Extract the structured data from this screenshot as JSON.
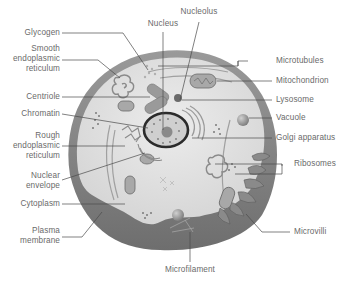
{
  "diagram": {
    "type": "labeled-illustration",
    "colors": {
      "background": "#ffffff",
      "cytoplasm": "#e4e4e4",
      "membrane": "#8c8c8c",
      "organelle": "#a8a8a8",
      "nucleus_outline": "#2b2b2b",
      "label_text": "#6a6a6a",
      "leader_line": "#4a4a4a"
    },
    "labels": {
      "glycogen": "Glycogen",
      "smooth_er_1": "Smooth",
      "smooth_er_2": "endoplasmic",
      "smooth_er_3": "reticulum",
      "centriole": "Centriole",
      "chromatin": "Chromatin",
      "rough_er_1": "Rough",
      "rough_er_2": "endoplasmic",
      "rough_er_3": "reticulum",
      "nuclear_envelope_1": "Nuclear",
      "nuclear_envelope_2": "envelope",
      "cytoplasm": "Cytoplasm",
      "plasma_membrane_1": "Plasma",
      "plasma_membrane_2": "membrane",
      "nucleus": "Nucleus",
      "nucleolus": "Nucleolus",
      "microtubules": "Microtubules",
      "mitochondrion": "Mitochondrion",
      "lysosome": "Lysosome",
      "vacuole": "Vacuole",
      "golgi_apparatus": "Golgi apparatus",
      "ribosomes": "Ribosomes",
      "microvilli": "Microvilli",
      "microfilament": "Microfilament"
    }
  }
}
